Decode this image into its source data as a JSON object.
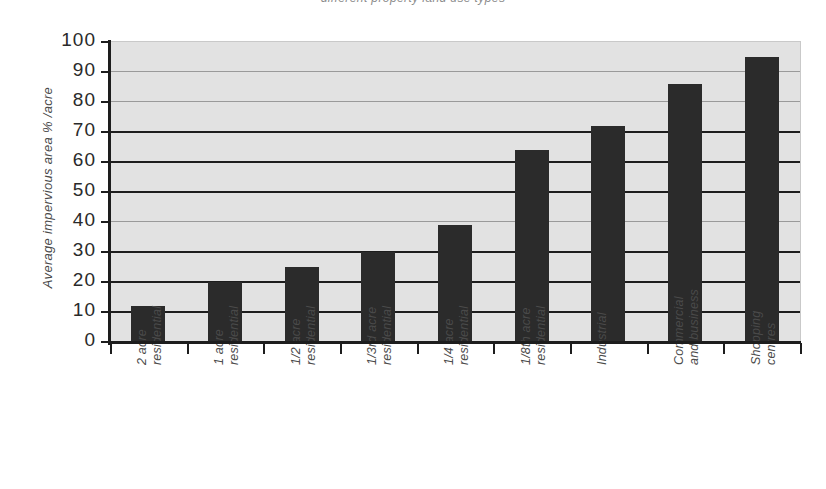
{
  "chart_data": {
    "type": "bar",
    "title": "different property land use types",
    "xlabel": "",
    "ylabel": "Average impervious area  % /acre",
    "ylim": [
      0,
      100
    ],
    "ytick_step": 10,
    "yticks": [
      "100",
      "90",
      "80",
      "70",
      "60",
      "50",
      "40",
      "30",
      "20",
      "10",
      "0"
    ],
    "grid": true,
    "legend": "none",
    "bar_color": "#2b2b2b",
    "plot_background": "#e2e2e2",
    "categories": [
      "2 acre residential",
      "1 acre residential",
      "1/2 acre residential",
      "1/3rd acre residential",
      "1/4 acre residential",
      "1/8th acre residential",
      "Industrial",
      "Commercial and business",
      "Shopping centres"
    ],
    "category_lines": [
      [
        "2 acre",
        "residential"
      ],
      [
        "1 acre",
        "residential"
      ],
      [
        "1/2 acre",
        "residential"
      ],
      [
        "1/3rd acre",
        "residential"
      ],
      [
        "1/4 acre",
        "residential"
      ],
      [
        "1/8th acre",
        "residential"
      ],
      [
        "Industrial",
        ""
      ],
      [
        "Commercial",
        "and business"
      ],
      [
        "Shopping",
        "centres"
      ]
    ],
    "values": [
      12,
      20,
      25,
      30,
      39,
      64,
      72,
      86,
      95
    ]
  }
}
